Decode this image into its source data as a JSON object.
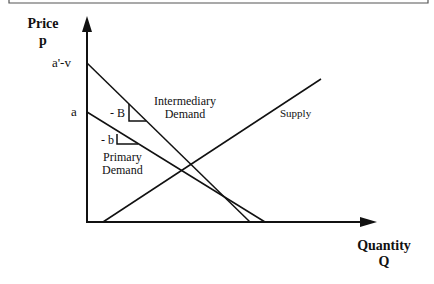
{
  "diagram": {
    "y_axis": {
      "label": "Price",
      "symbol": "p"
    },
    "x_axis": {
      "label": "Quantity",
      "symbol": "Q"
    },
    "intercepts": {
      "upper": "a'-v",
      "lower": "a"
    },
    "curves": [
      {
        "name": "Intermediary Demand",
        "line1": "Intermediary",
        "line2": "Demand",
        "slope_label": "- B"
      },
      {
        "name": "Primary Demand",
        "line1": "Primary",
        "line2": "Demand",
        "slope_label": "- b"
      },
      {
        "name": "Supply",
        "line1": "Supply"
      }
    ]
  }
}
